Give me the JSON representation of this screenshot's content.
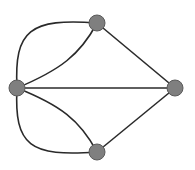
{
  "diagram": {
    "type": "graph",
    "colors": {
      "background": "#ffffff",
      "edge": "#2a2a2a",
      "node_fill": "#7f7f7f",
      "node_stroke": "#5a5a5a"
    },
    "nodes": [
      {
        "id": "top",
        "cx": 97,
        "cy": 23,
        "r": 8
      },
      {
        "id": "left",
        "cx": 17,
        "cy": 88,
        "r": 8
      },
      {
        "id": "right",
        "cx": 175,
        "cy": 88,
        "r": 8
      },
      {
        "id": "bottom",
        "cx": 97,
        "cy": 152,
        "r": 8
      }
    ],
    "edges": [
      {
        "from": "left",
        "to": "top",
        "shape": "outer-arc"
      },
      {
        "from": "left",
        "to": "top",
        "shape": "inner-curve"
      },
      {
        "from": "left",
        "to": "bottom",
        "shape": "outer-arc"
      },
      {
        "from": "left",
        "to": "bottom",
        "shape": "inner-curve"
      },
      {
        "from": "left",
        "to": "right",
        "shape": "straight"
      },
      {
        "from": "top",
        "to": "right",
        "shape": "straight"
      },
      {
        "from": "bottom",
        "to": "right",
        "shape": "straight"
      }
    ]
  }
}
